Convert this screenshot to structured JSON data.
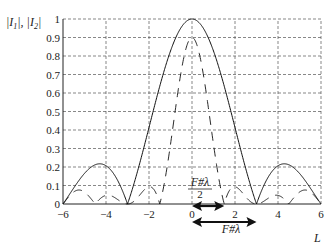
{
  "chart_data": {
    "type": "line",
    "title": "",
    "xlabel": "L",
    "ylabel": "|I1|, |I2|",
    "xlim": [
      -6,
      6
    ],
    "ylim": [
      0,
      1
    ],
    "xticks": [
      -6,
      -4,
      -2,
      0,
      2,
      4,
      6
    ],
    "yticks": [
      0,
      0.1,
      0.2,
      0.3,
      0.4,
      0.5,
      0.6,
      0.7,
      0.8,
      0.9,
      1
    ],
    "grid": true,
    "series": [
      {
        "name": "|I1|",
        "style": "solid",
        "x": [
          -6,
          -5.5,
          -5,
          -4.5,
          -4,
          -3.5,
          -3,
          -2.5,
          -2,
          -1.5,
          -1,
          -0.5,
          0,
          0.5,
          1,
          1.5,
          2,
          2.5,
          3,
          3.5,
          4,
          4.5,
          5,
          5.5,
          6
        ],
        "values": [
          0.05,
          0.15,
          0.2,
          0.22,
          0.2,
          0.12,
          0.0,
          0.2,
          0.42,
          0.63,
          0.82,
          0.95,
          1.0,
          0.95,
          0.82,
          0.63,
          0.42,
          0.2,
          0.0,
          0.12,
          0.2,
          0.22,
          0.2,
          0.15,
          0.05
        ]
      },
      {
        "name": "|I2|",
        "style": "dashed",
        "x": [
          -6,
          -5.5,
          -5,
          -4.5,
          -4,
          -3.5,
          -3,
          -2.5,
          -2,
          -1.5,
          -1,
          -0.5,
          0,
          0.5,
          1,
          1.5,
          2,
          2.5,
          3,
          3.5,
          4,
          4.5,
          5,
          5.5,
          6
        ],
        "values": [
          0.05,
          0.1,
          0.05,
          0.0,
          0.05,
          0.1,
          0.0,
          0.15,
          0.22,
          0.0,
          0.45,
          0.85,
          1.0,
          0.85,
          0.45,
          0.0,
          0.22,
          0.15,
          0.0,
          0.1,
          0.05,
          0.0,
          0.05,
          0.1,
          0.05
        ]
      }
    ],
    "annotations": [
      {
        "text": "F#λ/2",
        "numerator": "F#λ",
        "denominator": "2",
        "arrow_from": 0,
        "arrow_to": 1.5
      },
      {
        "text": "F#λ",
        "arrow_from": 0,
        "arrow_to": 3
      }
    ]
  },
  "labels": {
    "ylabel_a": "|I",
    "ylabel_sub1": "1",
    "ylabel_mid": "|, |I",
    "ylabel_sub2": "2",
    "ylabel_end": "|",
    "xlabel": "L",
    "ann1_num": "F#λ",
    "ann1_den": "2",
    "ann2": "F#λ"
  }
}
